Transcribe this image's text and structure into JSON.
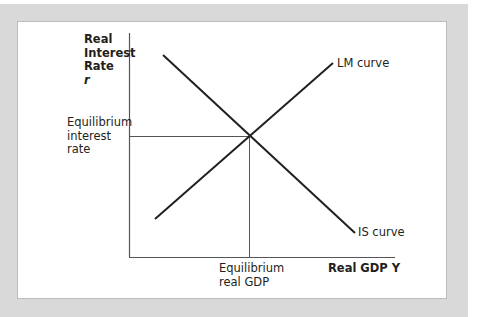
{
  "diagram": {
    "y_axis_label": [
      "Real",
      "Interest",
      "Rate",
      "r"
    ],
    "x_axis_label": "Real GDP Y",
    "curves": [
      {
        "name": "LM curve",
        "slope": "upward",
        "from": [
          155,
          219
        ],
        "to": [
          333,
          63
        ]
      },
      {
        "name": "IS curve",
        "slope": "downward",
        "from": [
          163,
          55
        ],
        "to": [
          355,
          233
        ]
      }
    ],
    "equilibrium_point": [
      249,
      136
    ],
    "y_marker_label": [
      "Equilibrium",
      "interest",
      "rate"
    ],
    "x_marker_label": [
      "Equilibrium",
      "real GDP"
    ],
    "colors": {
      "frame": "#d9d9d9",
      "panel": "#ffffff",
      "axis": "#555555",
      "curve": "#231f20",
      "text": "#231f20"
    }
  }
}
